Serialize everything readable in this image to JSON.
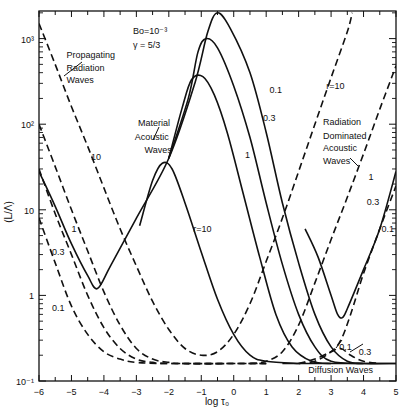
{
  "chart_data": {
    "type": "line",
    "title": "",
    "xlabel": "log τ₀",
    "ylabel": "(L/Λ)",
    "xlim": [
      -6,
      5
    ],
    "ylim": [
      0.1,
      2000
    ],
    "yscale": "log",
    "x_ticks": [
      -6,
      -5,
      -4,
      -3,
      -2,
      -1,
      0,
      1,
      2,
      3,
      4,
      5
    ],
    "y_ticks": [
      {
        "v": 0.1,
        "label": "10⁻¹"
      },
      {
        "v": 1,
        "label": "1"
      },
      {
        "v": 10,
        "label": "10"
      },
      {
        "v": 100,
        "label": "10²"
      },
      {
        "v": 1000,
        "label": "10³"
      }
    ],
    "parameters": {
      "bo": "Bo=10⁻³",
      "gamma": "γ = 5/3"
    },
    "annotations": [
      {
        "text": "Propagating",
        "x": -5.15,
        "y": 600
      },
      {
        "text": "Radiation",
        "x": -5.15,
        "y": 420
      },
      {
        "text": "Waves",
        "x": -5.15,
        "y": 300
      },
      {
        "text": "Material",
        "x": -2.95,
        "y": 95
      },
      {
        "text": "Acoustic",
        "x": -3.05,
        "y": 66
      },
      {
        "text": "Waves",
        "x": -2.75,
        "y": 46
      },
      {
        "text": "Radiation",
        "x": 2.75,
        "y": 97
      },
      {
        "text": "Dominated",
        "x": 2.75,
        "y": 68
      },
      {
        "text": "Acoustic",
        "x": 2.75,
        "y": 48
      },
      {
        "text": "Waves",
        "x": 2.75,
        "y": 34
      },
      {
        "text": "Diffusion Waves",
        "x": 2.3,
        "y": 0.125
      }
    ],
    "series": [
      {
        "name": "Material acoustic r=0.1",
        "style": "solid",
        "label": "0.1",
        "label_xy": [
          1.1,
          230
        ],
        "points": [
          [
            -6,
            28
          ],
          [
            -5.5,
            11
          ],
          [
            -5,
            4
          ],
          [
            -4.5,
            1.7
          ],
          [
            -4.2,
            1.2
          ],
          [
            -3.8,
            2.2
          ],
          [
            -3,
            8
          ],
          [
            -2,
            40
          ],
          [
            -1.2,
            300
          ],
          [
            -0.8,
            1200
          ],
          [
            -0.5,
            2000
          ],
          [
            -0.1,
            1300
          ],
          [
            0.5,
            400
          ],
          [
            1,
            80
          ],
          [
            1.5,
            12
          ],
          [
            2,
            2.4
          ],
          [
            2.5,
            0.6
          ],
          [
            3,
            0.25
          ],
          [
            3.5,
            0.17
          ],
          [
            4,
            0.16
          ],
          [
            5,
            0.16
          ]
        ]
      },
      {
        "name": "Material acoustic r=0.3",
        "style": "solid",
        "label": "0.3",
        "label_xy": [
          0.9,
          110
        ],
        "points": [
          [
            -2,
            40
          ],
          [
            -1.4,
            200
          ],
          [
            -1.1,
            700
          ],
          [
            -0.85,
            1000
          ],
          [
            -0.5,
            780
          ],
          [
            0,
            280
          ],
          [
            0.5,
            70
          ],
          [
            1,
            12
          ],
          [
            1.5,
            2.3
          ],
          [
            2,
            0.6
          ],
          [
            2.5,
            0.25
          ],
          [
            3,
            0.17
          ],
          [
            4,
            0.16
          ]
        ]
      },
      {
        "name": "Material acoustic r=1",
        "style": "solid",
        "label": "1",
        "label_xy": [
          0.35,
          40
        ],
        "points": [
          [
            -2,
            40
          ],
          [
            -1.6,
            150
          ],
          [
            -1.3,
            330
          ],
          [
            -0.95,
            360
          ],
          [
            -0.6,
            220
          ],
          [
            -0.2,
            80
          ],
          [
            0.3,
            15
          ],
          [
            0.8,
            2.8
          ],
          [
            1.3,
            0.6
          ],
          [
            1.8,
            0.25
          ],
          [
            2.4,
            0.17
          ],
          [
            3,
            0.16
          ]
        ]
      },
      {
        "name": "Material acoustic r=10",
        "style": "solid",
        "label": "r=10",
        "label_xy": [
          -1.25,
          5.5
        ],
        "points": [
          [
            -2.9,
            6.5
          ],
          [
            -2.5,
            22
          ],
          [
            -2.2,
            35
          ],
          [
            -1.9,
            30
          ],
          [
            -1.5,
            12
          ],
          [
            -1,
            3.2
          ],
          [
            -0.5,
            0.9
          ],
          [
            0,
            0.35
          ],
          [
            0.5,
            0.2
          ],
          [
            1,
            0.17
          ],
          [
            2,
            0.16
          ]
        ]
      },
      {
        "name": "Radiation r=0.1",
        "style": "dashed",
        "label": "0.1",
        "label_xy": [
          -5.6,
          0.65
        ],
        "points": [
          [
            -6,
            8
          ],
          [
            -5.5,
            2.4
          ],
          [
            -5,
            0.75
          ],
          [
            -4.5,
            0.35
          ],
          [
            -4,
            0.22
          ],
          [
            -3.5,
            0.18
          ],
          [
            -3,
            0.165
          ],
          [
            -2,
            0.16
          ],
          [
            1,
            0.16
          ]
        ]
      },
      {
        "name": "Radiation r=0.3",
        "style": "dashed",
        "label": "0.3",
        "label_xy": [
          -5.6,
          3
        ],
        "points": [
          [
            -6,
            30
          ],
          [
            -5.5,
            9
          ],
          [
            -5,
            3
          ],
          [
            -4.5,
            1
          ],
          [
            -4,
            0.42
          ],
          [
            -3.5,
            0.24
          ],
          [
            -3,
            0.18
          ],
          [
            -2.5,
            0.165
          ],
          [
            -2,
            0.16
          ],
          [
            1,
            0.16
          ]
        ]
      },
      {
        "name": "Radiation r=1",
        "style": "dashed",
        "label": "1",
        "label_xy": [
          -5.0,
          5.5
        ],
        "points": [
          [
            -6,
            100
          ],
          [
            -5.5,
            32
          ],
          [
            -5,
            10
          ],
          [
            -4.5,
            3.3
          ],
          [
            -4,
            1.1
          ],
          [
            -3.5,
            0.45
          ],
          [
            -3,
            0.24
          ],
          [
            -2.5,
            0.18
          ],
          [
            -2,
            0.165
          ],
          [
            -1.5,
            0.16
          ],
          [
            1,
            0.16
          ]
        ]
      },
      {
        "name": "Radiation r=10",
        "style": "dashed",
        "label": "10",
        "label_xy": [
          -4.4,
          38
        ],
        "points": [
          [
            -6,
            1500
          ],
          [
            -5.5,
            500
          ],
          [
            -5,
            160
          ],
          [
            -4.5,
            55
          ],
          [
            -4,
            18
          ],
          [
            -3.5,
            6
          ],
          [
            -3,
            2.2
          ],
          [
            -2.5,
            0.85
          ],
          [
            -2,
            0.4
          ],
          [
            -1.5,
            0.24
          ],
          [
            -1,
            0.2
          ],
          [
            -0.5,
            0.22
          ],
          [
            0,
            0.35
          ],
          [
            0.5,
            0.8
          ],
          [
            1,
            2.5
          ],
          [
            1.5,
            8
          ],
          [
            2,
            28
          ],
          [
            2.5,
            100
          ],
          [
            3,
            350
          ],
          [
            3.5,
            1200
          ],
          [
            3.65,
            2000
          ]
        ]
      },
      {
        "name": "Radiation dominated r=1",
        "style": "dashed",
        "label": "1",
        "label_xy": [
          4.15,
          22
        ],
        "points": [
          [
            0.5,
            0.16
          ],
          [
            1,
            0.17
          ],
          [
            1.5,
            0.22
          ],
          [
            2,
            0.45
          ],
          [
            2.5,
            1.4
          ],
          [
            3,
            4.5
          ],
          [
            3.5,
            14
          ],
          [
            4,
            45
          ],
          [
            4.5,
            150
          ],
          [
            5,
            480
          ]
        ]
      },
      {
        "name": "Radiation dominated r=0.3",
        "style": "dashed",
        "label": "0.3",
        "label_xy": [
          4.1,
          11.5
        ],
        "points": [
          [
            2,
            0.16
          ],
          [
            2.5,
            0.17
          ],
          [
            3,
            0.22
          ],
          [
            3.3,
            0.3
          ],
          [
            3.6,
            0.6
          ],
          [
            4,
            1.8
          ],
          [
            4.5,
            6
          ],
          [
            5,
            19
          ]
        ]
      },
      {
        "name": "Radiation dominated r=0.1",
        "style": "solid",
        "label": "0.1",
        "label_xy": [
          4.55,
          5.5
        ],
        "points": [
          [
            2.2,
            6
          ],
          [
            2.6,
            2.8
          ],
          [
            3,
            1.0
          ],
          [
            3.2,
            0.6
          ],
          [
            3.35,
            0.55
          ],
          [
            3.5,
            0.7
          ],
          [
            4,
            2.0
          ],
          [
            4.5,
            6
          ],
          [
            5,
            28
          ]
        ]
      },
      {
        "name": "Diffusion r=0.1",
        "style": "dashed",
        "label": "0.1",
        "label_xy": [
          3.25,
          0.23
        ],
        "points": [
          [
            2,
            0.16
          ],
          [
            2.5,
            0.18
          ],
          [
            3,
            0.22
          ],
          [
            3.3,
            0.24
          ],
          [
            3.6,
            0.2
          ],
          [
            4,
            0.17
          ],
          [
            4.5,
            0.16
          ]
        ]
      },
      {
        "name": "Radiation label r=10 right",
        "style": "none",
        "label": "r=10",
        "label_xy": [
          2.85,
          260
        ],
        "points": []
      }
    ]
  }
}
